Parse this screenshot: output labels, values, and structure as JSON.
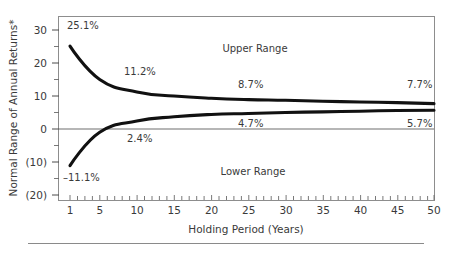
{
  "chart_data": {
    "type": "line",
    "title": "",
    "xlabel": "Holding Period (Years)",
    "ylabel": "Normal Range of Annual Returns*",
    "xlim": [
      0,
      51
    ],
    "ylim": [
      -20,
      33
    ],
    "grid": false,
    "legend_position": "inline-annotations",
    "x_ticks": [
      1,
      5,
      10,
      15,
      20,
      25,
      30,
      35,
      40,
      45,
      50
    ],
    "x_tick_labels": [
      "1",
      "5",
      "10",
      "15",
      "20",
      "25",
      "30",
      "35",
      "40",
      "45",
      "50"
    ],
    "x_minor_tick_step": 1,
    "y_ticks": [
      30,
      20,
      10,
      0,
      -10,
      -20
    ],
    "y_tick_labels": [
      "30",
      "20",
      "10",
      "0",
      "(10)",
      "(20)"
    ],
    "y_minor_ticks": [
      25,
      15,
      5,
      -5,
      -15
    ],
    "series": [
      {
        "name": "Upper Range",
        "x": [
          1,
          5,
          10,
          15,
          20,
          25,
          30,
          35,
          40,
          45,
          50
        ],
        "values": [
          25.1,
          15.0,
          11.2,
          10.0,
          9.3,
          8.9,
          8.7,
          8.4,
          8.2,
          8.0,
          7.7
        ]
      },
      {
        "name": "Lower Range",
        "x": [
          1,
          5,
          10,
          15,
          20,
          25,
          30,
          35,
          40,
          45,
          50
        ],
        "values": [
          -11.1,
          -1.0,
          2.4,
          3.7,
          4.4,
          4.7,
          5.0,
          5.2,
          5.4,
          5.6,
          5.7
        ]
      }
    ],
    "annotations": [
      {
        "text": "25.1%",
        "x": 1,
        "y": 25.1,
        "series": "Upper Range",
        "px": 67,
        "py": 29
      },
      {
        "text": "11.2%",
        "x": 10,
        "y": 11.2,
        "series": "Upper Range",
        "px": 124,
        "py": 75
      },
      {
        "text": "8.7%",
        "x": 30,
        "y": 8.7,
        "series": "Upper Range",
        "px": 238,
        "py": 88
      },
      {
        "text": "7.7%",
        "x": 50,
        "y": 7.7,
        "series": "Upper Range",
        "px": 407,
        "py": 88
      },
      {
        "text": "-11.1%",
        "x": 1,
        "y": -11.1,
        "series": "Lower Range",
        "px": 63,
        "py": 180
      },
      {
        "text": "2.4%",
        "x": 10,
        "y": 2.4,
        "series": "Lower Range",
        "px": 127,
        "py": 141
      },
      {
        "text": "4.7%",
        "x": 25,
        "y": 4.7,
        "series": "Lower Range",
        "px": 238,
        "py": 126
      },
      {
        "text": "5.7%",
        "x": 50,
        "y": 5.7,
        "series": "Lower Range",
        "px": 407,
        "py": 126
      }
    ],
    "region_labels": [
      {
        "text": "Upper Range",
        "px": 255,
        "py": 52
      },
      {
        "text": "Lower Range",
        "px": 253,
        "py": 175
      }
    ],
    "colors": {
      "line": "#111111",
      "frame": "#8d8d8d",
      "text": "#3a3a3a",
      "background": "#ffffff"
    }
  },
  "axis": {
    "y_title": "Normal Range of Annual Returns*",
    "x_title": "Holding Period (Years)"
  },
  "y_tick_labels": {
    "t0": "30",
    "t1": "20",
    "t2": "10",
    "t3": "0",
    "t4": "(10)",
    "t5": "(20)"
  },
  "x_tick_labels": {
    "t0": "1",
    "t1": "5",
    "t2": "10",
    "t3": "15",
    "t4": "20",
    "t5": "25",
    "t6": "30",
    "t7": "35",
    "t8": "40",
    "t9": "45",
    "t10": "50"
  },
  "region_labels": {
    "upper": "Upper Range",
    "lower": "Lower Range"
  },
  "point_labels": {
    "upper_1": "25.1%",
    "upper_10": "11.2%",
    "upper_30": "8.7%",
    "upper_50": "7.7%",
    "lower_1": "–11.1%",
    "lower_10": "2.4%",
    "lower_25": "4.7%",
    "lower_50": "5.7%"
  }
}
